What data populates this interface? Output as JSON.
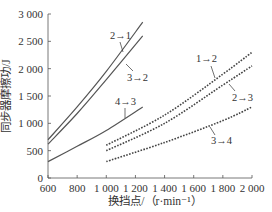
{
  "chart_data": {
    "type": "line",
    "title": "",
    "xlabel": "换挡点/（r·min⁻¹）",
    "ylabel": "同步器摩擦功/J",
    "xlim": [
      600,
      2000
    ],
    "ylim": [
      0,
      3000
    ],
    "x_ticks": [
      600,
      800,
      1000,
      1200,
      1400,
      1600,
      1800,
      2000
    ],
    "x_tick_labels": [
      "600",
      "800",
      "1 000",
      "1 200",
      "1 400",
      "1 600",
      "1 800",
      "2 000"
    ],
    "y_ticks": [
      0,
      500,
      1000,
      1500,
      2000,
      2500,
      3000
    ],
    "y_tick_labels": [
      "0",
      "500",
      "1 000",
      "1 500",
      "2 000",
      "2 500",
      "3 000"
    ],
    "grid": false,
    "legend": "inline annotations",
    "series": [
      {
        "name": "2→1",
        "style": "solid",
        "x": [
          600,
          800,
          1000,
          1250
        ],
        "y": [
          700,
          1300,
          1950,
          2850
        ]
      },
      {
        "name": "3→2",
        "style": "solid",
        "x": [
          600,
          800,
          1000,
          1250
        ],
        "y": [
          620,
          1180,
          1800,
          2600
        ]
      },
      {
        "name": "4→3",
        "style": "solid",
        "x": [
          600,
          800,
          1000,
          1250
        ],
        "y": [
          300,
          580,
          870,
          1300
        ]
      },
      {
        "name": "1→2",
        "style": "dashed",
        "x": [
          1000,
          1400,
          1800,
          2000
        ],
        "y": [
          600,
          1150,
          1900,
          2300
        ]
      },
      {
        "name": "2→3",
        "style": "dashed",
        "x": [
          1000,
          1400,
          1800,
          2000
        ],
        "y": [
          500,
          1000,
          1700,
          2050
        ]
      },
      {
        "name": "3→4",
        "style": "dashed",
        "x": [
          1000,
          1400,
          1800,
          2000
        ],
        "y": [
          300,
          650,
          1050,
          1300
        ]
      }
    ]
  },
  "labels": {
    "s21": "2→1",
    "s32": "3→2",
    "s43": "4→3",
    "s12": "1→2",
    "s23": "2→3",
    "s34": "3→4"
  }
}
